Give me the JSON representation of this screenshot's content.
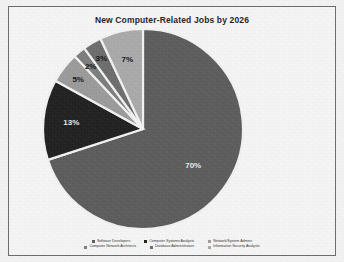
{
  "chart_data": {
    "type": "pie",
    "title": "New Computer-Related Jobs by 2026",
    "xlabel": "",
    "ylabel": "",
    "legend_position": "bottom",
    "grid": false,
    "categories": [
      "Software Developers",
      "Computer Systems Analysts",
      "Network/System Admins",
      "Computer Network Architects",
      "Database Administrators",
      "Information Security Analysts"
    ],
    "values": [
      70,
      13,
      5,
      2,
      3,
      7
    ],
    "value_labels": [
      "70%",
      "13%",
      "5%",
      "2%",
      "3%",
      "7%"
    ],
    "colors": [
      "#5b5b5b",
      "#1f1f1f",
      "#9a9a9a",
      "#7c7c7c",
      "#6c6c6c",
      "#a9a9a9"
    ],
    "slice_separator_color": "#f2f2f2"
  },
  "legend": {
    "rows": [
      [
        {
          "label": "Software Developers",
          "color": "#5b5b5b"
        },
        {
          "label": "Computer Systems Analysts",
          "color": "#1f1f1f"
        },
        {
          "label": "Network/System Admins",
          "color": "#9a9a9a"
        }
      ],
      [
        {
          "label": "Computer Network Architects",
          "color": "#7c7c7c"
        },
        {
          "label": "Database Administrators",
          "color": "#6c6c6c"
        },
        {
          "label": "Information Security Analysts",
          "color": "#a9a9a9"
        }
      ]
    ]
  },
  "style": {
    "background": "#f3f3f3",
    "frame_color": "#6b6b6b",
    "title_color": "#1d1d1d"
  }
}
